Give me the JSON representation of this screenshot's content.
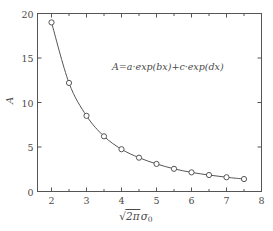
{
  "chart_data": {
    "type": "line",
    "title": "",
    "subtitle": "",
    "xlabel": "√(2π)σ₀",
    "ylabel": "A",
    "xlim": [
      1.6,
      8.0
    ],
    "ylim": [
      0,
      20
    ],
    "grid": false,
    "legend": null,
    "marker": "open-circle",
    "line_color": "#555555",
    "marker_color": "#555555",
    "x": [
      2.0,
      2.5,
      3.0,
      3.5,
      4.0,
      4.5,
      5.0,
      5.5,
      6.0,
      6.5,
      7.0,
      7.5
    ],
    "values": [
      19.0,
      12.2,
      8.5,
      6.2,
      4.75,
      3.8,
      3.1,
      2.55,
      2.15,
      1.85,
      1.6,
      1.4
    ],
    "series": [
      {
        "name": "A",
        "x": [
          2.0,
          2.5,
          3.0,
          3.5,
          4.0,
          4.5,
          5.0,
          5.5,
          6.0,
          6.5,
          7.0,
          7.5
        ],
        "values": [
          19.0,
          12.2,
          8.5,
          6.2,
          4.75,
          3.8,
          3.1,
          2.55,
          2.15,
          1.85,
          1.6,
          1.4
        ]
      }
    ],
    "xticks": [
      2,
      3,
      4,
      5,
      6,
      7,
      8
    ],
    "xticklabels": [
      "2",
      "3",
      "4",
      "5",
      "6",
      "7",
      "8"
    ],
    "xminorticks": [
      2.5,
      3.5,
      4.5,
      5.5,
      6.5,
      7.5
    ],
    "yticks": [
      0,
      5,
      10,
      15,
      20
    ],
    "yticklabels": [
      "0",
      "5",
      "10",
      "15",
      "20"
    ],
    "annotations": [
      {
        "text": "A=a·exp(bx)+c·exp(dx)",
        "x": 4.3,
        "y": 16.2
      }
    ]
  },
  "axes": {
    "y_label_text": "A",
    "x_label": {
      "sqrt_symbol": "√",
      "radicand": "2π",
      "sigma": "σ",
      "subscript": "0"
    }
  },
  "equation": {
    "lhs": "A",
    "equals": "=",
    "term1_coeff": "a",
    "dot": "·",
    "exp": "exp",
    "term1_arg": "(bx)",
    "plus": "+",
    "term2_coeff": "c",
    "term2_arg": "(dx)",
    "full": "A=a·exp(bx)+c·exp(dx)"
  },
  "style": {
    "axis_color": "#555555",
    "text_color": "#4a4a4a",
    "background": "#ffffff"
  }
}
